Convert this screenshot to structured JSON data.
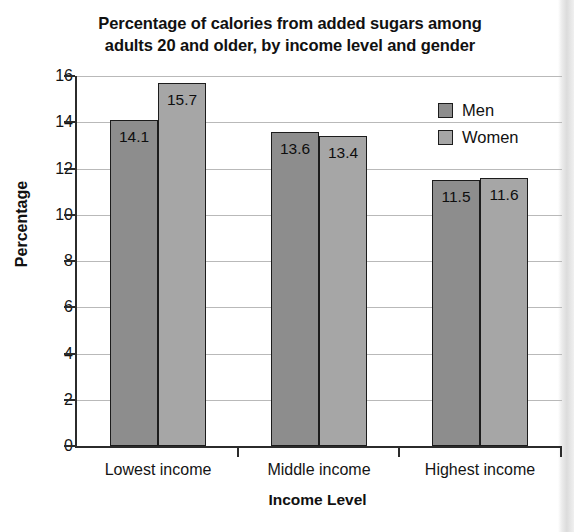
{
  "chart_data": {
    "type": "bar",
    "title": "Percentage of calories from added sugars among adults 20 and older, by income level and gender",
    "title_lines": [
      "Percentage of calories from added sugars among",
      "adults 20 and older, by income level and gender"
    ],
    "xlabel": "Income Level",
    "ylabel": "Percentage",
    "categories": [
      "Lowest income",
      "Middle income",
      "Highest income"
    ],
    "series": [
      {
        "name": "Men",
        "color": "#8d8d8d",
        "values": [
          14.1,
          13.6,
          11.5
        ]
      },
      {
        "name": "Women",
        "color": "#a6a6a6",
        "values": [
          15.7,
          13.4,
          11.6
        ]
      }
    ],
    "ylim": [
      0,
      16
    ],
    "ytick_values": [
      16,
      14,
      12,
      10,
      8,
      6,
      4,
      2,
      0
    ],
    "ytick_labels": [
      "16",
      "14",
      "12",
      "10",
      "8",
      "6",
      "4",
      "2",
      "0"
    ],
    "grid": true,
    "legend_position": "top-right",
    "bar_labels": [
      [
        "14.1",
        "15.7"
      ],
      [
        "13.6",
        "13.4"
      ],
      [
        "11.5",
        "11.6"
      ]
    ]
  },
  "legend": {
    "entries": [
      {
        "label": "Men",
        "swatch": "men-swatch"
      },
      {
        "label": "Women",
        "swatch": "women-swatch"
      }
    ]
  }
}
